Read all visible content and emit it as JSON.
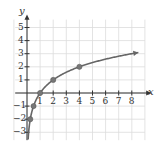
{
  "chart_data": {
    "type": "line",
    "title": "",
    "xlabel": "x",
    "ylabel": "y",
    "xlim": [
      -1,
      9
    ],
    "ylim": [
      -3.5,
      5.5
    ],
    "grid": true,
    "x_ticks": [
      "1",
      "2",
      "3",
      "4",
      "5",
      "6",
      "7",
      "8"
    ],
    "y_ticks": [
      "5",
      "4",
      "3",
      "2",
      "1",
      "-1",
      "-2",
      "-3"
    ],
    "series": [
      {
        "name": "curve",
        "color": "#666666",
        "points": [
          [
            0.25,
            -2
          ],
          [
            0.5,
            -1
          ],
          [
            1,
            0
          ],
          [
            2,
            1
          ],
          [
            4,
            2
          ]
        ],
        "arrow_end": [
          8.5,
          3.09
        ]
      }
    ]
  },
  "axes": {
    "x_label": "x",
    "y_label": "y"
  }
}
